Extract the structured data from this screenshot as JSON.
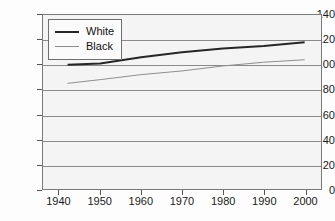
{
  "chart_data": {
    "type": "line",
    "title": "",
    "xlabel": "",
    "ylabel": "",
    "xlim": [
      1936,
      2004
    ],
    "ylim": [
      0,
      140
    ],
    "grid": true,
    "legend_position": "top-left",
    "y_ticks": [
      0,
      20,
      40,
      60,
      80,
      100,
      120,
      140
    ],
    "x_ticks": [
      1940,
      1950,
      1960,
      1970,
      1980,
      1990,
      2000
    ],
    "series": [
      {
        "name": "White",
        "color": "#262626",
        "width": 2,
        "x": [
          1942,
          1950,
          1960,
          1970,
          1980,
          1990,
          2000
        ],
        "values": [
          100,
          101,
          106,
          110,
          113,
          115,
          118
        ]
      },
      {
        "name": "Black",
        "color": "#8e8e8e",
        "width": 1,
        "x": [
          1942,
          1950,
          1960,
          1970,
          1980,
          1990,
          2000
        ],
        "values": [
          85,
          88,
          92,
          95,
          99,
          102,
          104
        ]
      }
    ]
  },
  "legend": {
    "entries": [
      {
        "label": "White"
      },
      {
        "label": "Black"
      }
    ]
  },
  "axes": {
    "y_labels": [
      "140",
      "120",
      "100",
      "80",
      "60",
      "40",
      "20",
      "0"
    ],
    "x_labels": [
      "1940",
      "1950",
      "1960",
      "1970",
      "1980",
      "1990",
      "2000"
    ]
  }
}
